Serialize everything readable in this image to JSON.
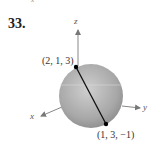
{
  "problem": {
    "number": "33.",
    "stray_mark": "x"
  },
  "axes": {
    "x_label": "x",
    "y_label": "y",
    "z_label": "z"
  },
  "points": [
    {
      "label": "(2, 1, 3)",
      "coords": [
        2,
        1,
        3
      ]
    },
    {
      "label": "(1, 3, −1)",
      "coords": [
        1,
        3,
        -1
      ]
    }
  ],
  "colors": {
    "sphere_light": "#c9c9c9",
    "sphere_dark": "#8a8a8a",
    "axis": "#777777",
    "segment": "#111111"
  }
}
